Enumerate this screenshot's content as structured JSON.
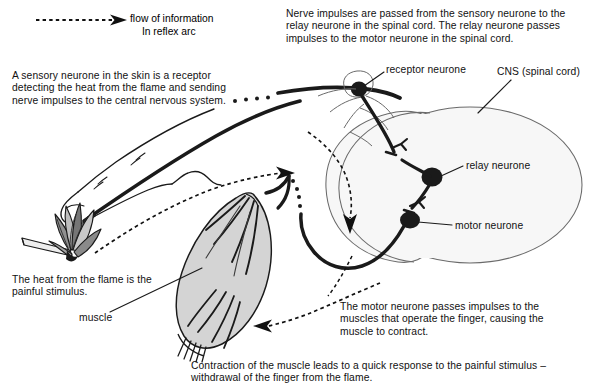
{
  "diagram": {
    "legend": {
      "line1": "flow of information",
      "line2": "In reflex arc",
      "arrow_icon": "dashed-arrow-icon"
    },
    "annotations": {
      "sensory": "A sensory neurone in the skin is a receptor detecting the heat from the flame and sending nerve impulses to the central nervous system.",
      "nerve_impulses": "Nerve impulses are passed from the sensory neurone to the relay neurone in the spinal cord. The relay neurone passes impulses to the motor neurone in the spinal cord.",
      "heat": "The heat from the flame is the painful stimulus.",
      "motor_passes": "The motor neurone passes impulses to the muscles that operate the finger, causing the muscle to contract.",
      "contraction": "Contraction of the muscle leads to a quick response to the painful stimulus – withdrawal of the finger from the flame."
    },
    "labels": {
      "receptor_neurone": "receptor neurone",
      "cns": "CNS (spinal cord)",
      "relay_neurone": "relay neurone",
      "motor_neurone": "motor neurone",
      "muscle": "muscle"
    },
    "colors": {
      "ink": "#111111",
      "nerve_stroke": "#1a1a1a",
      "spinal_cord_fill": "#f7f7f7",
      "spinal_cord_stroke": "#555555",
      "muscle_fill": "#d4d4d4",
      "muscle_stroke": "#1a1a1a",
      "flame_fill": "#9a9a9a",
      "background": "#ffffff"
    }
  }
}
